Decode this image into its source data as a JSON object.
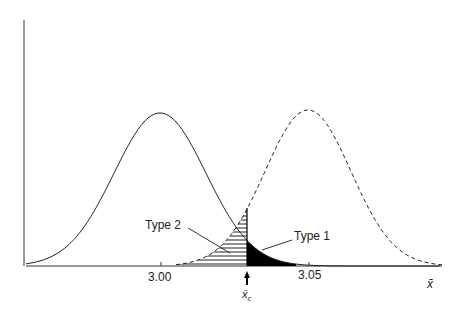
{
  "chart_data": {
    "type": "line",
    "title": "",
    "xlabel": "x̄",
    "ylabel": "",
    "x_ticks": [
      "3.00",
      "3.05"
    ],
    "critical_value_label": "x̄c",
    "critical_value_approx": 3.029,
    "series": [
      {
        "name": "Null distribution (mean 3.00)",
        "style": "solid",
        "mean": 3.0,
        "sd_approx": 0.015
      },
      {
        "name": "Alternative distribution (mean 3.05)",
        "style": "dashed",
        "mean": 3.05,
        "sd_approx": 0.015
      }
    ],
    "annotations": [
      {
        "text": "Type 1",
        "region": "solid tail right of x̄c",
        "fill": "black"
      },
      {
        "text": "Type 2",
        "region": "dashed tail left of x̄c",
        "fill": "horizontal hatching"
      }
    ],
    "grid": false,
    "legend": "none"
  },
  "labels": {
    "tick1": "3.00",
    "tick2": "3.05",
    "xaxis": "x̄",
    "xc": "x̄",
    "xc_sub": "c",
    "type1": "Type 1",
    "type2": "Type 2"
  }
}
